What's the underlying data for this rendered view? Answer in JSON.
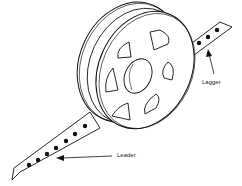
{
  "diagram": {
    "labels": {
      "leader": "Leader",
      "lagger": "Lagger"
    },
    "colors": {
      "stroke": "#111111",
      "fill": "#ffffff"
    }
  }
}
